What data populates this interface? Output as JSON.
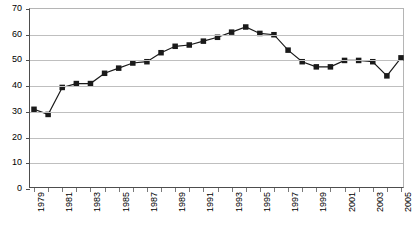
{
  "chart_data": {
    "type": "line",
    "title": "",
    "subtitle": "",
    "xlabel": "",
    "ylabel": "",
    "x": [
      1979,
      1980,
      1981,
      1982,
      1983,
      1984,
      1985,
      1986,
      1987,
      1988,
      1989,
      1990,
      1991,
      1992,
      1993,
      1994,
      1995,
      1996,
      1997,
      1998,
      1999,
      2000,
      2001,
      2002,
      2003,
      2004,
      2005
    ],
    "values": [
      31,
      29,
      39.5,
      41,
      41,
      45,
      47,
      49,
      49.5,
      53,
      55.5,
      56,
      57.5,
      59,
      61,
      63,
      60.5,
      60,
      54,
      49.5,
      47.5,
      47.5,
      50,
      50,
      49.5,
      44,
      51
    ],
    "series": [
      {
        "name": "series-1",
        "values": [
          31,
          29,
          39.5,
          41,
          41,
          45,
          47,
          49,
          49.5,
          53,
          55.5,
          56,
          57.5,
          59,
          61,
          63,
          60.5,
          60,
          54,
          49.5,
          47.5,
          47.5,
          50,
          50,
          49.5,
          44,
          51
        ]
      }
    ],
    "y_ticks": [
      0,
      10,
      20,
      30,
      40,
      50,
      60,
      70
    ],
    "x_tick_labels": [
      "1979",
      "",
      "1981",
      "",
      "1983",
      "",
      "1985",
      "",
      "1987",
      "",
      "1989",
      "",
      "1991",
      "",
      "1993",
      "",
      "1995",
      "",
      "1997",
      "",
      "1999",
      "",
      "2001",
      "",
      "2003",
      "",
      "2005"
    ],
    "ylim": [
      0,
      70
    ],
    "xlim": [
      1979,
      2005
    ],
    "grid": true,
    "legend": "none",
    "marker": "square",
    "marker_color": "#1a1a1a",
    "line_color": "#1a1a1a"
  }
}
